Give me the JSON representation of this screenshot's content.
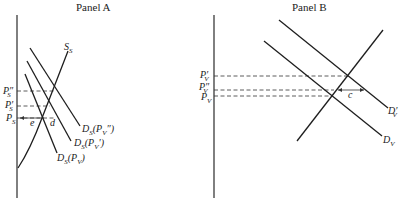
{
  "panels": {
    "a": {
      "title": "Panel A",
      "price_labels": {
        "ps_double_prime": "P″",
        "ps_prime": "P′",
        "ps": "P",
        "sub": "S"
      },
      "supply_label": "S",
      "supply_sub": "S",
      "demand_labels": {
        "d_pv_double_prime": {
          "main": "D",
          "sub": "S",
          "arg": "(P",
          "arg_sub": "V",
          "mark": "″)"
        },
        "d_pv_prime": {
          "main": "D",
          "sub": "S",
          "arg": "(P",
          "arg_sub": "V",
          "mark": "′)"
        },
        "d_pv": {
          "main": "D",
          "sub": "S",
          "arg": "(P",
          "arg_sub": "V",
          "mark": ")"
        }
      },
      "points": {
        "e": "e",
        "d": "d"
      }
    },
    "b": {
      "title": "Panel B",
      "price_labels": {
        "pv_prime": "P′",
        "pv_double_prime": "P″",
        "pv": "P",
        "sub": "V"
      },
      "demand_labels": {
        "dv_prime": {
          "main": "D′",
          "sub": "V"
        },
        "dv": {
          "main": "D",
          "sub": "V"
        }
      },
      "points": {
        "c": "c"
      }
    }
  }
}
